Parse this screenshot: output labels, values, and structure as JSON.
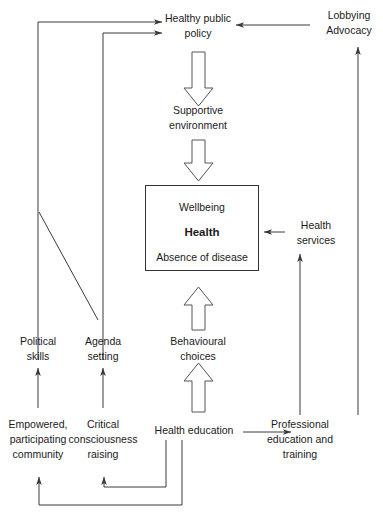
{
  "diagram": {
    "background_color": "#ffffff",
    "line_color": "#3a3a3a",
    "text_color": "#1a1a1a",
    "box_border_color": "#333333",
    "block_arrow_fill": "#ffffff",
    "block_arrow_stroke": "#555555"
  },
  "nodes": {
    "healthy_public_policy": {
      "line1": "Healthy public",
      "line2": "policy"
    },
    "lobbying_advocacy": {
      "line1": "Lobbying",
      "line2": "Advocacy"
    },
    "supportive_environment": {
      "line1": "Supportive",
      "line2": "environment"
    },
    "core_box": {
      "wellbeing": "Wellbeing",
      "health": "Health",
      "absence_of_disease": "Absence of disease"
    },
    "health_services": {
      "line1": "Health",
      "line2": "services"
    },
    "political_skills": {
      "line1": "Political",
      "line2": "skills"
    },
    "agenda_setting": {
      "line1": "Agenda",
      "line2": "setting"
    },
    "behavioural_choices": {
      "line1": "Behavioural",
      "line2": "choices"
    },
    "empowered_community": {
      "line1": "Empowered,",
      "line2": "participating",
      "line3": "community"
    },
    "critical_consciousness": {
      "line1": "Critical",
      "line2": "consciousness",
      "line3": "raising"
    },
    "health_education": {
      "line1": "Health education"
    },
    "professional_education": {
      "line1": "Professional",
      "line2": "education and",
      "line3": "training"
    }
  },
  "edges": [
    {
      "name": "political-skills-to-healthy-public-policy",
      "type": "thin-arrow"
    },
    {
      "name": "agenda-setting-to-healthy-public-policy",
      "type": "thin-arrow"
    },
    {
      "name": "lobbying-to-healthy-public-policy",
      "type": "thin-arrow"
    },
    {
      "name": "healthy-public-policy-to-supportive-environment",
      "type": "block-arrow-down"
    },
    {
      "name": "supportive-environment-to-core-box",
      "type": "block-arrow-down"
    },
    {
      "name": "behavioural-choices-to-core-box",
      "type": "block-arrow-up"
    },
    {
      "name": "health-education-to-behavioural-choices",
      "type": "block-arrow-up"
    },
    {
      "name": "health-services-to-core-box",
      "type": "thin-arrow"
    },
    {
      "name": "professional-education-to-health-services",
      "type": "thin-arrow"
    },
    {
      "name": "professional-education-to-lobbying",
      "type": "thin-arrow"
    },
    {
      "name": "health-education-to-professional-education",
      "type": "thin-arrow"
    },
    {
      "name": "empowered-community-to-political-skills",
      "type": "thin-arrow"
    },
    {
      "name": "critical-consciousness-to-agenda-setting",
      "type": "thin-arrow"
    },
    {
      "name": "health-education-to-critical-consciousness",
      "type": "thin-arrow"
    },
    {
      "name": "health-education-to-empowered-community",
      "type": "thin-arrow"
    },
    {
      "name": "political-skills-diagonal-to-agenda-setting",
      "type": "thin-line"
    }
  ]
}
